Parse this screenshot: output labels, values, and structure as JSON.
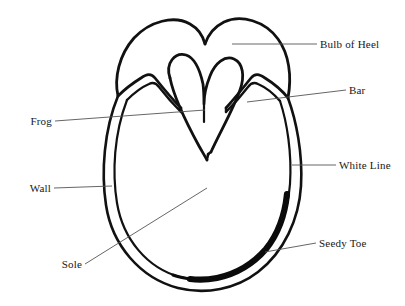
{
  "diagram": {
    "ink_color": "#111111",
    "leader_color": "#555555",
    "background_color": "#ffffff",
    "labels": {
      "bulb_of_heel": "Bulb of Heel",
      "bar": "Bar",
      "white_line": "White Line",
      "seedy_toe": "Seedy Toe",
      "frog": "Frog",
      "wall": "Wall",
      "sole": "Sole"
    }
  }
}
